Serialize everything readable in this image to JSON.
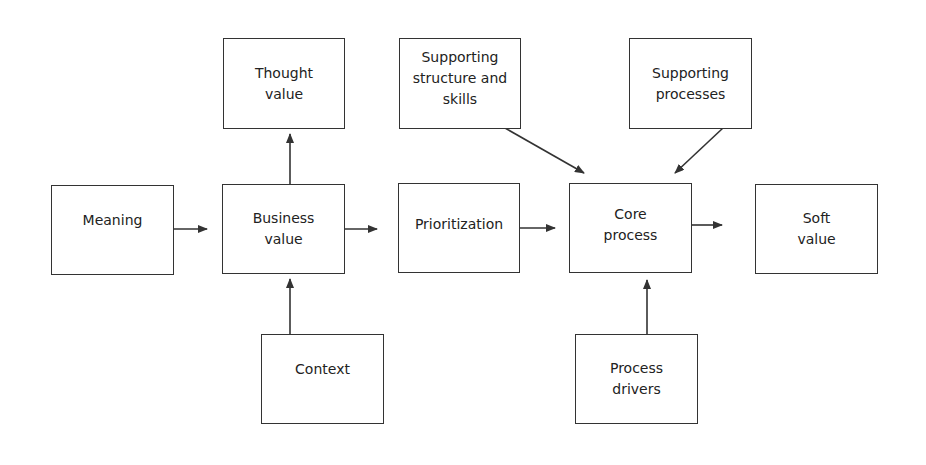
{
  "diagram": {
    "type": "flow",
    "nodes": [
      {
        "id": "thought_value",
        "label": "Thought\nvalue"
      },
      {
        "id": "supporting_structure",
        "label": "Supporting\nstructure and\nskills"
      },
      {
        "id": "supporting_processes",
        "label": "Supporting\nprocesses"
      },
      {
        "id": "meaning",
        "label": "Meaning"
      },
      {
        "id": "business_value",
        "label": "Business\nvalue"
      },
      {
        "id": "prioritization",
        "label": "Prioritization"
      },
      {
        "id": "core_process",
        "label": "Core\nprocess"
      },
      {
        "id": "soft_value",
        "label": "Soft\nvalue"
      },
      {
        "id": "context",
        "label": "Context"
      },
      {
        "id": "process_drivers",
        "label": "Process\ndrivers"
      }
    ],
    "edges": [
      {
        "from": "meaning",
        "to": "business_value"
      },
      {
        "from": "business_value",
        "to": "thought_value"
      },
      {
        "from": "context",
        "to": "business_value"
      },
      {
        "from": "business_value",
        "to": "prioritization"
      },
      {
        "from": "prioritization",
        "to": "core_process"
      },
      {
        "from": "supporting_structure",
        "to": "core_process"
      },
      {
        "from": "supporting_processes",
        "to": "core_process"
      },
      {
        "from": "process_drivers",
        "to": "core_process"
      },
      {
        "from": "core_process",
        "to": "soft_value"
      }
    ],
    "colors": {
      "stroke": "#333333",
      "background": "#ffffff",
      "text": "#222222"
    }
  }
}
